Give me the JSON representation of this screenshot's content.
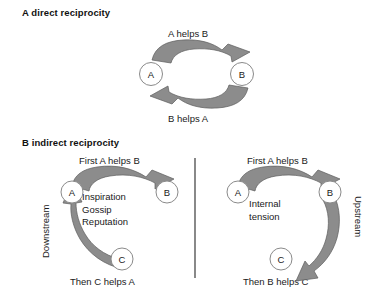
{
  "figure": {
    "width": 390,
    "height": 295,
    "background": "#ffffff",
    "arrow_fill": "#8c8c8c",
    "arrow_stroke": "#5d5d5d",
    "node_fill": "#ffffff",
    "node_stroke": "#8a8a8a",
    "divider_color": "#3a3a3a"
  },
  "panel_a": {
    "heading": "A direct reciprocity",
    "caption_top": "A helps B",
    "caption_bottom": "B helps A",
    "nodes": [
      {
        "id": "a",
        "label": "A"
      },
      {
        "id": "b",
        "label": "B"
      }
    ],
    "arrows": [
      {
        "id": "a-to-b",
        "from": "A",
        "to": "B",
        "label": "A helps B"
      },
      {
        "id": "b-to-a",
        "from": "B",
        "to": "A",
        "label": "B helps A"
      }
    ]
  },
  "panel_b": {
    "heading": "B indirect reciprocity",
    "left": {
      "caption_top": "First A  helps B",
      "caption_bottom": "Then C helps A",
      "side_label": "Downstream",
      "center_lines": [
        "Inspiration",
        "Gossip",
        "Reputation"
      ],
      "nodes": [
        {
          "id": "a",
          "label": "A"
        },
        {
          "id": "b",
          "label": "B"
        },
        {
          "id": "c",
          "label": "C"
        }
      ],
      "arrows": [
        {
          "id": "a-to-b",
          "from": "A",
          "to": "B",
          "label": "First A  helps B"
        },
        {
          "id": "c-to-a",
          "from": "C",
          "to": "A",
          "label": "Then C helps A"
        }
      ]
    },
    "right": {
      "caption_top": "First A helps B",
      "caption_bottom": "Then B helps C",
      "side_label": "Upstream",
      "center_lines": [
        "Internal",
        "tension"
      ],
      "nodes": [
        {
          "id": "a",
          "label": "A"
        },
        {
          "id": "b",
          "label": "B"
        },
        {
          "id": "c",
          "label": "C"
        }
      ],
      "arrows": [
        {
          "id": "a-to-b",
          "from": "A",
          "to": "B",
          "label": "First A helps B"
        },
        {
          "id": "b-to-c",
          "from": "B",
          "to": "C",
          "label": "Then B helps C"
        }
      ]
    }
  }
}
